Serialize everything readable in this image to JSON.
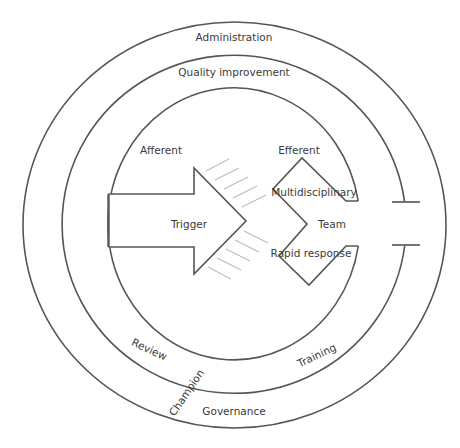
{
  "diagram": {
    "rings": {
      "outer": {
        "label_top": "Administration",
        "label_bottom": "Governance"
      },
      "middle": {
        "label_top": "Quality improvement",
        "label_bottom_left": "Review",
        "label_bottom_right": "Training"
      },
      "crossing_label": "Champion"
    },
    "afferent": {
      "heading": "Afferent",
      "arrow_label": "Trigger"
    },
    "efferent": {
      "heading": "Efferent",
      "labels": {
        "top": "Multidisciplinary",
        "middle": "Team",
        "bottom": "Rapid response"
      }
    },
    "colors": {
      "line": "#555555",
      "hatch": "#bdbdbd",
      "text": "#3a3a3a",
      "background": "#ffffff"
    }
  }
}
